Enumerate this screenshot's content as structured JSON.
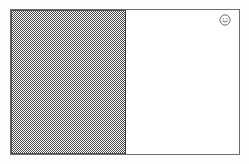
{
  "document": {
    "title": "Untitled Document",
    "background_color": "#ffffff",
    "frame_border_color": "#6d6d6d"
  },
  "shaded_panel": {
    "label": "Shaded Block",
    "fill_style": "halftone-dither-50",
    "fill_color": "#4a4a4a",
    "border_color": "#3b3b3b"
  },
  "content_area": {
    "label": "Blank Content Area",
    "background_color": "#ffffff",
    "text": ""
  },
  "badge": {
    "icon": "smiley-face-icon",
    "label": "",
    "color": "#555555"
  }
}
